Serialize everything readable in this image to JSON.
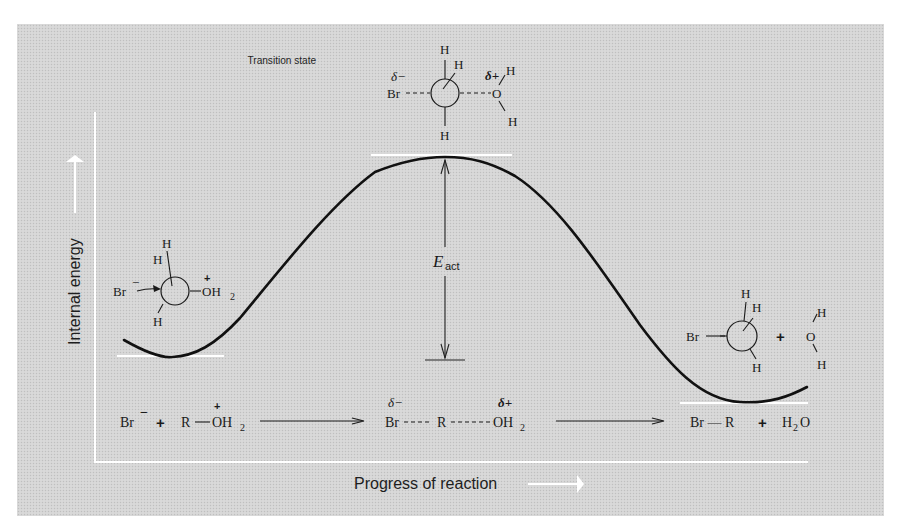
{
  "figure": {
    "transition_state_label": "Transition state",
    "y_axis_label": "Internal energy",
    "x_axis_label": "Progress of reaction",
    "activation_energy": {
      "symbol": "E",
      "subscript": "act"
    },
    "colors": {
      "panel_background": "#d5d5d5",
      "curve": "#111111",
      "axes": "#ffffff",
      "level_lines": "#ffffff",
      "text": "#1a1a1a"
    }
  },
  "structures": {
    "reactant": {
      "br": "Br",
      "br_charge": "−",
      "h_top": "H",
      "h_upper_left": "H",
      "h_bottom": "H",
      "oh2": "OH",
      "oh2_sub": "2",
      "oh2_charge": "+"
    },
    "transition_state": {
      "br": "Br",
      "br_delta": "δ−",
      "h_top": "H",
      "h_upper_right": "H",
      "h_bottom": "H",
      "o": "O",
      "o_delta": "δ+",
      "o_h_top": "H",
      "o_h_bottom": "H"
    },
    "product": {
      "br": "Br",
      "h_top": "H",
      "h_upper_right": "H",
      "h_bottom": "H",
      "plus": "+",
      "water_o": "O",
      "water_h_top": "H",
      "water_h_bottom": "H"
    }
  },
  "equation": {
    "reactants": {
      "br": "Br",
      "br_charge": "−",
      "plus": "+",
      "r": "R",
      "oh2": "OH",
      "oh2_sub": "2",
      "oh2_charge": "+"
    },
    "transition": {
      "br": "Br",
      "br_delta": "δ−",
      "dash1": "----",
      "r": "R",
      "dash2": "-----",
      "oh2": "OH",
      "oh2_sub": "2",
      "oh2_delta": "δ+"
    },
    "products": {
      "br_r": "Br — R",
      "plus": "+",
      "h2o_h": "H",
      "h2o_sub": "2",
      "h2o_o": "O"
    }
  }
}
